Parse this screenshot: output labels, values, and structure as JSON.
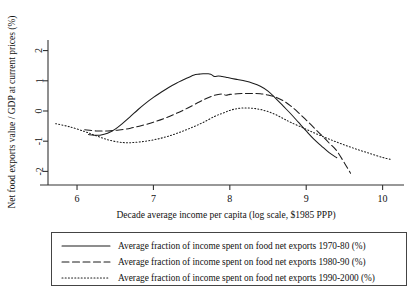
{
  "chart_data": {
    "type": "line",
    "title": "",
    "xlabel": "Decade average income per capita (log scale, $1985 PPP)",
    "ylabel": "Net food exports value / GDP at current prices (%)",
    "xlim": [
      5.62,
      10.28
    ],
    "ylim": [
      -2.45,
      2.35
    ],
    "xticks": [
      6,
      7,
      8,
      9,
      10
    ],
    "xtick_labels": [
      "6",
      "7",
      "8",
      "9",
      "10"
    ],
    "yticks": [
      -2,
      -1,
      0,
      1,
      2
    ],
    "ytick_labels": [
      "-2",
      "-1",
      "0",
      "1",
      "2"
    ],
    "grid": false,
    "legend_position": "below-plot",
    "series": [
      {
        "name": "Average fraction of income spent on food net exports 1970-80 (%)",
        "style": "solid",
        "color": "#1c1c1c",
        "x": [
          6.15,
          6.22,
          6.3,
          6.4,
          6.5,
          6.6,
          6.7,
          6.8,
          6.9,
          7.0,
          7.1,
          7.2,
          7.3,
          7.4,
          7.5,
          7.55,
          7.6,
          7.65,
          7.7,
          7.75,
          7.8,
          7.85,
          7.9,
          7.95,
          8.0,
          8.1,
          8.2,
          8.3,
          8.4,
          8.5,
          8.6,
          8.7,
          8.8,
          8.9,
          9.0,
          9.1,
          9.2,
          9.3,
          9.4
        ],
        "y": [
          -0.78,
          -0.8,
          -0.8,
          -0.74,
          -0.6,
          -0.4,
          -0.18,
          0.05,
          0.26,
          0.45,
          0.62,
          0.78,
          0.92,
          1.04,
          1.16,
          1.21,
          1.22,
          1.23,
          1.23,
          1.22,
          1.14,
          1.16,
          1.14,
          1.12,
          1.09,
          1.04,
          0.99,
          0.92,
          0.82,
          0.66,
          0.42,
          0.16,
          -0.1,
          -0.38,
          -0.66,
          -0.93,
          -1.16,
          -1.38,
          -1.55
        ]
      },
      {
        "name": "Average fraction of income spent on food net exports 1980-90 (%)",
        "style": "dashed",
        "color": "#1c1c1c",
        "x": [
          6.1,
          6.25,
          6.4,
          6.55,
          6.7,
          6.85,
          7.0,
          7.15,
          7.3,
          7.45,
          7.6,
          7.7,
          7.8,
          7.9,
          7.95,
          8.0,
          8.05,
          8.1,
          8.2,
          8.3,
          8.4,
          8.5,
          8.6,
          8.7,
          8.8,
          8.9,
          9.0,
          9.1,
          9.2,
          9.3,
          9.4,
          9.5,
          9.58
        ],
        "y": [
          -0.62,
          -0.66,
          -0.66,
          -0.63,
          -0.57,
          -0.48,
          -0.37,
          -0.24,
          -0.08,
          0.1,
          0.3,
          0.42,
          0.52,
          0.56,
          0.52,
          0.55,
          0.56,
          0.57,
          0.58,
          0.58,
          0.57,
          0.53,
          0.46,
          0.34,
          0.16,
          -0.06,
          -0.3,
          -0.55,
          -0.8,
          -1.06,
          -1.32,
          -1.72,
          -2.06
        ]
      },
      {
        "name": "Average fraction of income spent on food net exports 1990-2000 (%)",
        "style": "dotted",
        "color": "#1c1c1c",
        "x": [
          5.72,
          5.9,
          6.1,
          6.25,
          6.4,
          6.55,
          6.65,
          6.75,
          6.9,
          7.05,
          7.2,
          7.35,
          7.5,
          7.65,
          7.8,
          7.9,
          8.0,
          8.1,
          8.2,
          8.3,
          8.4,
          8.5,
          8.6,
          8.7,
          8.8,
          8.95,
          9.1,
          9.25,
          9.4,
          9.55,
          9.7,
          9.85,
          10.0,
          10.1
        ],
        "y": [
          -0.42,
          -0.52,
          -0.68,
          -0.82,
          -0.95,
          -1.03,
          -1.05,
          -1.04,
          -1.0,
          -0.93,
          -0.83,
          -0.7,
          -0.55,
          -0.38,
          -0.18,
          -0.08,
          0.02,
          0.08,
          0.1,
          0.09,
          0.05,
          -0.02,
          -0.12,
          -0.25,
          -0.38,
          -0.55,
          -0.72,
          -0.88,
          -1.03,
          -1.17,
          -1.3,
          -1.42,
          -1.54,
          -1.6
        ]
      }
    ]
  },
  "legend": {
    "entries": [
      {
        "label": "Average fraction of income spent on food net exports 1970-80 (%)",
        "style": "solid"
      },
      {
        "label": "Average fraction of income spent on food net exports 1980-90 (%)",
        "style": "dashed"
      },
      {
        "label": "Average fraction of income spent on food net exports 1990-2000 (%)",
        "style": "dotted"
      }
    ]
  }
}
